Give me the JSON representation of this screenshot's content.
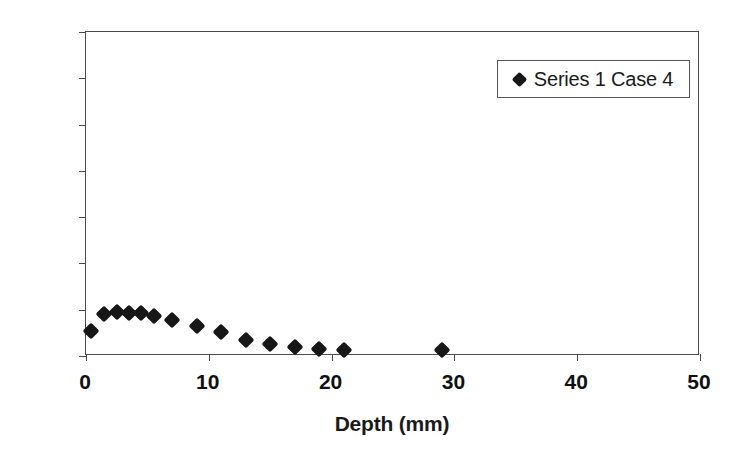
{
  "chart_data": {
    "type": "scatter",
    "title": "",
    "xlabel": "Depth (mm)",
    "ylabel": "Cl- [mass% of binder]",
    "xlim": [
      0,
      50
    ],
    "ylim": [
      0,
      7
    ],
    "xticks": [
      "0",
      "10",
      "20",
      "30",
      "40",
      "50"
    ],
    "yticks": [
      "0",
      "1",
      "2",
      "3",
      "4",
      "5",
      "6",
      "7"
    ],
    "grid": false,
    "legend_position": "top-right",
    "series": [
      {
        "name": "Series 1 Case 4",
        "marker": "diamond",
        "color": "#171717",
        "x": [
          0.4,
          1.5,
          2.5,
          3.5,
          4.5,
          5.5,
          7.0,
          9.0,
          11.0,
          13.0,
          15.0,
          17.0,
          19.0,
          21.0,
          29.0
        ],
        "y": [
          0.55,
          0.9,
          0.95,
          0.93,
          0.92,
          0.87,
          0.78,
          0.65,
          0.52,
          0.35,
          0.27,
          0.19,
          0.15,
          0.12,
          0.13
        ]
      }
    ]
  },
  "legend": {
    "entries": [
      {
        "label": "Series 1 Case 4",
        "marker": "diamond-marker-icon"
      }
    ]
  }
}
